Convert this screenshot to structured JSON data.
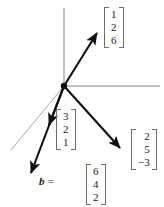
{
  "figure": {
    "type": "vector-diagram",
    "width": 164,
    "height": 207,
    "background": "#ffffff",
    "origin": {
      "x": 64,
      "y": 86,
      "dot_radius": 3.2,
      "color": "#111111"
    }
  },
  "colors": {
    "axis": "#8a8a8a",
    "axis_faint": "#a8a8a8",
    "vector": "#111111",
    "bracket": "#6e6e6e",
    "text": "#1a1a1a"
  },
  "axes": [
    {
      "name": "vertical-axis",
      "x1": 64,
      "y1": 86,
      "x2": 64,
      "y2": 8,
      "width": 1.1,
      "color": "#8a8a8a"
    },
    {
      "name": "horizontal-axis",
      "x1": 64,
      "y1": 86,
      "x2": 160,
      "y2": 86,
      "width": 1.1,
      "color": "#8a8a8a"
    },
    {
      "name": "depth-axis",
      "x1": 64,
      "y1": 86,
      "x2": 11,
      "y2": 150,
      "width": 1.0,
      "color": "#a8a8a8"
    }
  ],
  "vectors": [
    {
      "name": "vector-126",
      "label": "column-vector-1-2-6",
      "x1": 64,
      "y1": 86,
      "x2": 98,
      "y2": 32,
      "width": 2.1,
      "color": "#111111",
      "components": [
        "1",
        "2",
        "6"
      ]
    },
    {
      "name": "vector-25-3",
      "label": "column-vector-2-5-minus3",
      "x1": 64,
      "y1": 86,
      "x2": 122,
      "y2": 150,
      "width": 2.1,
      "color": "#111111",
      "components": [
        "2",
        "5",
        "−3"
      ]
    },
    {
      "name": "vector-321",
      "label": "column-vector-3-2-1",
      "x1": 64,
      "y1": 86,
      "x2": 48,
      "y2": 127,
      "width": 2.1,
      "color": "#111111",
      "components": [
        "3",
        "2",
        "1"
      ]
    },
    {
      "name": "vector-b",
      "label": "column-vector-b-6-4-2",
      "x1": 64,
      "y1": 86,
      "x2": 29,
      "y2": 176,
      "width": 2.1,
      "color": "#111111",
      "components": [
        "6",
        "4",
        "2"
      ],
      "name_text": "b",
      "equals_text": "="
    }
  ],
  "labels": {
    "vec_126": {
      "name": "label-vector-126",
      "left": 104,
      "top": 7,
      "values": [
        "1",
        "2",
        "6"
      ]
    },
    "vec_25m3": {
      "name": "label-vector-25-3",
      "left": 131,
      "top": 129,
      "values": [
        "2",
        "5",
        "−3"
      ]
    },
    "vec_321": {
      "name": "label-vector-321",
      "left": 56,
      "top": 109,
      "values": [
        "3",
        "2",
        "1"
      ]
    },
    "vec_b": {
      "name": "label-vector-b",
      "left": 86,
      "top": 164,
      "values": [
        "6",
        "4",
        "2"
      ],
      "prefix_symbol": "b",
      "prefix_equals": "=",
      "prefix_left": 39,
      "prefix_top": 175
    }
  }
}
